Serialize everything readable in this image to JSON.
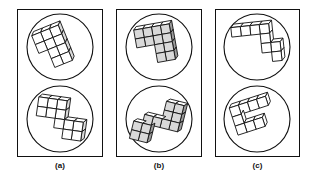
{
  "figure": {
    "type": "mental-rotation-stimuli",
    "background_color": "#ffffff",
    "line_color": "#111111",
    "panel_count": 3,
    "circles_per_panel": 2
  },
  "panels": [
    {
      "label": "(a)",
      "box": {
        "x": 17,
        "y": 9,
        "w": 86,
        "h": 148
      },
      "label_box": {
        "x": 17,
        "y": 161,
        "w": 86
      },
      "circles": [
        {
          "name": "upper",
          "cx": 60,
          "cy": 47,
          "r": 33,
          "shape": {
            "description": "ten-cube chunky block cluster, tilted",
            "cube_size": 9.5,
            "rotation_deg": -22,
            "origin_x": 38,
            "origin_y": 26,
            "cells": [
              [
                0,
                0
              ],
              [
                1,
                0
              ],
              [
                2,
                0
              ],
              [
                0,
                1
              ],
              [
                1,
                1
              ],
              [
                2,
                1
              ],
              [
                1,
                2
              ],
              [
                2,
                2
              ],
              [
                1,
                3
              ],
              [
                2,
                3
              ]
            ],
            "shading": "light"
          }
        },
        {
          "name": "lower",
          "cx": 60,
          "cy": 119,
          "r": 33,
          "shape": {
            "description": "ten-cube stepped block cluster, tilted",
            "cube_size": 9.5,
            "rotation_deg": 8,
            "origin_x": 36,
            "origin_y": 100,
            "cells": [
              [
                0,
                0
              ],
              [
                1,
                0
              ],
              [
                2,
                0
              ],
              [
                0,
                1
              ],
              [
                1,
                1
              ],
              [
                2,
                1
              ],
              [
                2,
                2
              ],
              [
                3,
                2
              ],
              [
                4,
                2
              ],
              [
                3,
                3
              ],
              [
                4,
                3
              ]
            ],
            "shading": "light"
          }
        }
      ]
    },
    {
      "label": "(b)",
      "box": {
        "x": 116,
        "y": 9,
        "w": 86,
        "h": 148
      },
      "label_box": {
        "x": 116,
        "y": 161,
        "w": 86
      },
      "circles": [
        {
          "name": "upper",
          "cx": 159,
          "cy": 47,
          "r": 33,
          "shape": {
            "description": "three-dimensional elbow of cubes seen from above",
            "cube_size": 9.0,
            "rotation_deg": -10,
            "origin_x": 137,
            "origin_y": 26,
            "cells": [
              [
                0,
                0
              ],
              [
                1,
                0
              ],
              [
                2,
                0
              ],
              [
                3,
                0
              ],
              [
                0,
                1
              ],
              [
                1,
                1
              ],
              [
                2,
                1
              ],
              [
                3,
                1
              ],
              [
                2,
                2
              ],
              [
                3,
                2
              ],
              [
                2,
                3
              ],
              [
                3,
                3
              ]
            ],
            "shading": "dark"
          }
        },
        {
          "name": "lower",
          "cx": 159,
          "cy": 119,
          "r": 33,
          "shape": {
            "description": "three-dimensional zig-zag arm of cubes",
            "cube_size": 9.0,
            "rotation_deg": 14,
            "origin_x": 135,
            "origin_y": 100,
            "cells": [
              [
                3,
                0
              ],
              [
                4,
                0
              ],
              [
                3,
                1
              ],
              [
                4,
                1
              ],
              [
                1,
                2
              ],
              [
                2,
                2
              ],
              [
                3,
                2
              ],
              [
                4,
                2
              ],
              [
                0,
                3
              ],
              [
                1,
                3
              ],
              [
                0,
                4
              ],
              [
                1,
                4
              ]
            ],
            "shading": "dark"
          }
        }
      ]
    },
    {
      "label": "(c)",
      "box": {
        "x": 215,
        "y": 9,
        "w": 85,
        "h": 148
      },
      "label_box": {
        "x": 215,
        "y": 161,
        "w": 85
      },
      "circles": [
        {
          "name": "upper",
          "cx": 257,
          "cy": 47,
          "r": 33,
          "shape": {
            "description": "flat S / Z shaped strip of cubes, tilted",
            "cube_size": 9.5,
            "rotation_deg": -6,
            "origin_x": 233,
            "origin_y": 25,
            "cells": [
              [
                0,
                0
              ],
              [
                1,
                0
              ],
              [
                2,
                0
              ],
              [
                3,
                0
              ],
              [
                3,
                1
              ],
              [
                3,
                2
              ],
              [
                4,
                2
              ],
              [
                4,
                3
              ]
            ],
            "shading": "flat"
          }
        },
        {
          "name": "lower",
          "cx": 257,
          "cy": 119,
          "r": 33,
          "shape": {
            "description": "flat L shaped strip of cubes, tilted",
            "cube_size": 9.5,
            "rotation_deg": -18,
            "origin_x": 234,
            "origin_y": 100,
            "cells": [
              [
                0,
                0
              ],
              [
                1,
                0
              ],
              [
                2,
                0
              ],
              [
                3,
                0
              ],
              [
                0,
                1
              ],
              [
                0,
                2
              ],
              [
                1,
                2
              ],
              [
                2,
                2
              ]
            ],
            "shading": "flat"
          }
        }
      ]
    }
  ]
}
